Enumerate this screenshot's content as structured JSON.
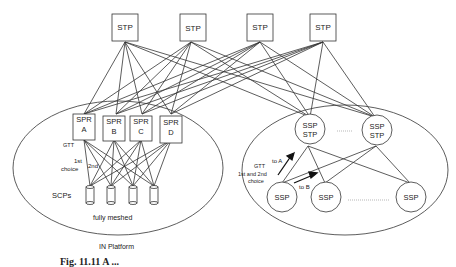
{
  "diagram": {
    "stps": [
      {
        "label": "STP",
        "x": 127,
        "y": 14
      },
      {
        "label": "STP",
        "x": 190,
        "y": 14
      },
      {
        "label": "STP",
        "x": 247,
        "y": 14
      },
      {
        "label": "STP",
        "x": 310,
        "y": 14
      }
    ],
    "left_cluster": {
      "label": "IN Platform",
      "sprs": [
        {
          "line1": "SPR",
          "line2": "A"
        },
        {
          "line1": "SPR",
          "line2": "B"
        },
        {
          "line1": "SPR",
          "line2": "C"
        },
        {
          "line1": "SPR",
          "line2": "D"
        }
      ],
      "gtt_label": "GTT",
      "first_label": "1st",
      "choice_label": "choice",
      "second_label": "2nd",
      "scps_label": "SCPs",
      "mesh_label": "fully meshed"
    },
    "right_cluster": {
      "ssp_stp": [
        {
          "line1": "SSP",
          "line2": "STP"
        },
        {
          "line1": "SSP",
          "line2": "STP"
        }
      ],
      "ssps": [
        {
          "label": "SSP"
        },
        {
          "label": "SSP"
        },
        {
          "label": "SSP"
        }
      ],
      "gtt_label": "GTT",
      "gtt_line2": "1st and 2nd",
      "gtt_line3": "choice",
      "to_a": "to A",
      "to_b": "to B"
    },
    "caption": "Fig. 11.11 A ..."
  }
}
